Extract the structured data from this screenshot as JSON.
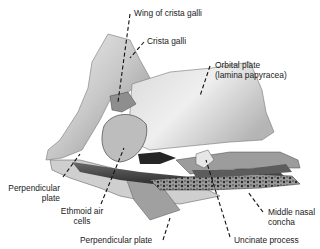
{
  "figure": {
    "colors": {
      "bone_light": "#e6e6e6",
      "bone_mid": "#a8a8a8",
      "bone_dark": "#3a3a3a",
      "leader": "#111111",
      "text": "#1a1a1a",
      "background": "#ffffff"
    },
    "labels": [
      {
        "id": "wing-of-crista-galli",
        "text": "Wing of crista galli"
      },
      {
        "id": "crista-galli",
        "text": "Crista galli"
      },
      {
        "id": "orbital-plate-line1",
        "text": "Orbital plate"
      },
      {
        "id": "orbital-plate-line2",
        "text": "(lamina papyracea)"
      },
      {
        "id": "perpendicular-plate-left-line1",
        "text": "Perpendicular"
      },
      {
        "id": "perpendicular-plate-left-line2",
        "text": "plate"
      },
      {
        "id": "ethmoid-air-cells-line1",
        "text": "Ethmoid air"
      },
      {
        "id": "ethmoid-air-cells-line2",
        "text": "cells"
      },
      {
        "id": "perpendicular-plate-bottom",
        "text": "Perpendicular plate"
      },
      {
        "id": "uncinate-process",
        "text": "Uncinate process"
      },
      {
        "id": "middle-nasal-concha-line1",
        "text": "Middle nasal"
      },
      {
        "id": "middle-nasal-concha-line2",
        "text": "concha"
      }
    ]
  }
}
